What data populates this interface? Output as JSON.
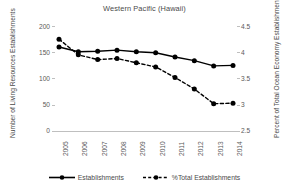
{
  "chart_data": {
    "type": "line",
    "title": "Western Pacific (Hawaii)",
    "xlabel": "",
    "ylabel": "Number of Living Resources Establishments",
    "y2label": "Percent of Total Ocean Economy Establishments",
    "categories": [
      "2005",
      "2006",
      "2007",
      "2008",
      "2009",
      "2010",
      "2011",
      "2012",
      "2013",
      "2014"
    ],
    "ylim": [
      0,
      200
    ],
    "yticks": [
      "0",
      "50",
      "100",
      "150",
      "200"
    ],
    "y2lim": [
      2.5,
      4.5
    ],
    "y2ticks": [
      "2.5",
      "3",
      "3.5",
      "4",
      "4.5"
    ],
    "grid": false,
    "legend_position": "bottom",
    "series": [
      {
        "name": "Establishments",
        "axis": "left",
        "style": "solid",
        "color": "#000000",
        "marker": "circle",
        "values": [
          160,
          151,
          152,
          154,
          151,
          149,
          141,
          134,
          124,
          125
        ]
      },
      {
        "name": "%Total Establishments",
        "axis": "right",
        "style": "dashed",
        "color": "#000000",
        "marker": "circle",
        "values": [
          4.25,
          3.95,
          3.86,
          3.88,
          3.8,
          3.72,
          3.52,
          3.3,
          3.02,
          3.03
        ]
      }
    ]
  },
  "colors": {
    "series": "#000000",
    "axis": "#bfbfbf",
    "text": "#4a4a4a",
    "tick_text": "#595959",
    "background": "#ffffff"
  }
}
